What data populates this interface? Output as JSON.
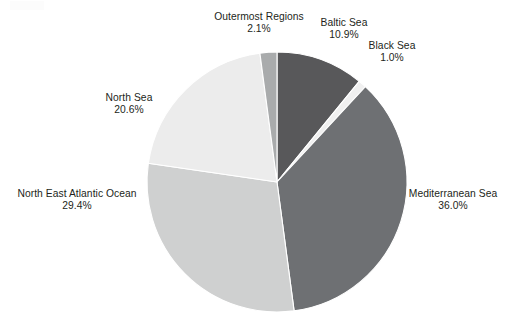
{
  "chart_data": {
    "type": "pie",
    "title": "",
    "subtitle": "",
    "xlabel": "",
    "ylabel": "",
    "legend_position": "none",
    "grid": false,
    "label_format": "name + percentage",
    "start_angle_deg": 0,
    "direction": "clockwise",
    "categories": [
      "Baltic Sea",
      "Black Sea",
      "Mediterranean Sea",
      "North East Atlantic Ocean",
      "North Sea",
      "Outermost Regions"
    ],
    "values": [
      10.9,
      1.0,
      36.0,
      29.4,
      20.6,
      2.1
    ],
    "unit": "%",
    "total": 100.0,
    "slices": [
      {
        "name": "Baltic Sea",
        "value": 10.9,
        "label": "Baltic Sea",
        "value_label": "10.9%",
        "color": "#58585a"
      },
      {
        "name": "Black Sea",
        "value": 1.0,
        "label": "Black Sea",
        "value_label": "1.0%",
        "color": "#f0f0f0"
      },
      {
        "name": "Mediterranean Sea",
        "value": 36.0,
        "label": "Mediterranean Sea",
        "value_label": "36.0%",
        "color": "#6e7073"
      },
      {
        "name": "North East Atlantic Ocean",
        "value": 29.4,
        "label": "North East Atlantic Ocean",
        "value_label": "29.4%",
        "color": "#cfd0d0"
      },
      {
        "name": "North Sea",
        "value": 20.6,
        "label": "North Sea",
        "value_label": "20.6%",
        "color": "#ececec"
      },
      {
        "name": "Outermost Regions",
        "value": 2.1,
        "label": "Outermost Regions",
        "value_label": "2.1%",
        "color": "#a9abac"
      }
    ],
    "geometry": {
      "center_x": 277,
      "center_y": 182,
      "radius": 130
    },
    "colors": {
      "text": "#231f20",
      "background": "#ffffff",
      "slice_outline": "#ffffff"
    }
  }
}
